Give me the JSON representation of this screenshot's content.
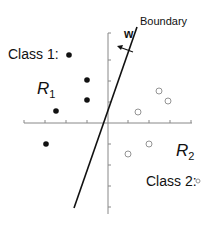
{
  "diagram": {
    "labels": {
      "class1": "Class 1:",
      "class2": "Class 2:",
      "region1": "R",
      "region1_sub": "1",
      "region2": "R",
      "region2_sub": "2",
      "boundary": "Boundary",
      "weight": "w"
    },
    "axes": {
      "origin": [
        108,
        123
      ],
      "x_range": [
        24,
        192
      ],
      "y_range": [
        33,
        214
      ],
      "x_ticks": [
        24,
        45,
        66,
        87,
        128,
        149,
        170,
        191
      ],
      "y_ticks": [
        33,
        60,
        81,
        102,
        144,
        165,
        186,
        207
      ],
      "color": "#888888"
    },
    "boundary_line": {
      "x1": 74,
      "y1": 208,
      "x2": 137,
      "y2": 27,
      "color": "#111111"
    },
    "weight_vector": {
      "x1": 133,
      "y1": 52,
      "x2": 117,
      "y2": 46,
      "color": "#111111"
    },
    "class1_points": [
      [
        87,
        80
      ],
      [
        87,
        100
      ],
      [
        56,
        111
      ],
      [
        46,
        144
      ]
    ],
    "class2_points": [
      [
        159,
        91
      ],
      [
        168,
        101
      ],
      [
        138,
        112
      ],
      [
        128,
        154
      ],
      [
        149,
        144
      ]
    ],
    "class1_legend_point": [
      69,
      55
    ],
    "class2_legend_point": [
      198,
      181
    ],
    "colors": {
      "class1_fill": "#111111",
      "class2_stroke": "#888888"
    }
  }
}
